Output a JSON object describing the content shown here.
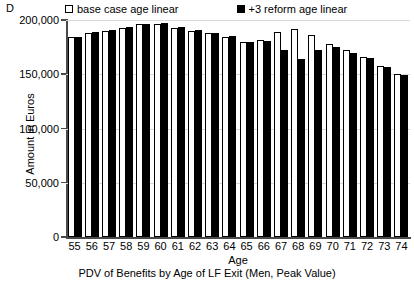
{
  "panel": {
    "label": "D"
  },
  "legend": {
    "position": "top",
    "entries": [
      {
        "label": "base case age linear",
        "marker": "open-square-icon",
        "color": "#ffffff"
      },
      {
        "label": "+3 reform age linear",
        "marker": "filled-square-icon",
        "color": "#000000"
      }
    ]
  },
  "chart_data": {
    "type": "bar",
    "title": "PDV of Benefits by Age of LF Exit (Men, Peak Value)",
    "panel_label": "D",
    "xlabel": "Age",
    "ylabel": "Amount in Euros",
    "categories": [
      "55",
      "56",
      "57",
      "58",
      "59",
      "60",
      "61",
      "62",
      "63",
      "64",
      "65",
      "66",
      "67",
      "68",
      "69",
      "70",
      "71",
      "72",
      "73",
      "74"
    ],
    "series": [
      {
        "name": "base case age linear",
        "color": "#ffffff",
        "values": [
          184000,
          188000,
          190000,
          193000,
          196000,
          196000,
          193000,
          190000,
          188000,
          184000,
          180000,
          182000,
          189000,
          192000,
          186000,
          178000,
          172000,
          166000,
          158000,
          150000
        ]
      },
      {
        "name": "+3 reform age linear",
        "color": "#000000",
        "values": [
          184000,
          189000,
          191000,
          194000,
          196000,
          197000,
          194000,
          191000,
          188000,
          185000,
          180000,
          181000,
          172000,
          164000,
          172000,
          175000,
          170000,
          165000,
          157000,
          149000
        ]
      }
    ],
    "yticks": [
      "0",
      "50,000",
      "100,000",
      "150,000",
      "200,000"
    ],
    "ytick_values": [
      0,
      50000,
      100000,
      150000,
      200000
    ],
    "ylim": [
      0,
      200000
    ],
    "grid": true,
    "legend_position": "top"
  }
}
